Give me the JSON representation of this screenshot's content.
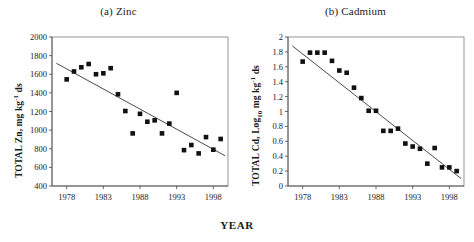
{
  "figure": {
    "xlabel": "YEAR",
    "panels": [
      {
        "id": "zinc",
        "title": "(a) Zinc",
        "ylabel_text": "TOTAL Zn, mg kg-1 ds"
      },
      {
        "id": "cadmium",
        "title": "(b) Cadmium",
        "ylabel_text": "TOTAL Cd, Log10 mg kg-1 ds"
      }
    ]
  },
  "chart_data": [
    {
      "type": "scatter",
      "title": "(a) Zinc",
      "xlabel": "YEAR",
      "ylabel": "TOTAL Zn, mg kg-1 ds",
      "xlim": [
        1976,
        2000
      ],
      "ylim": [
        400,
        2000
      ],
      "xticks": [
        1978,
        1983,
        1988,
        1993,
        1998
      ],
      "yticks": [
        400,
        600,
        800,
        1000,
        1200,
        1400,
        1600,
        1800,
        2000
      ],
      "grid": false,
      "legend": "none",
      "marker": "filled-square",
      "x": [
        1978,
        1979,
        1980,
        1981,
        1982,
        1983,
        1984,
        1985,
        1986,
        1987,
        1988,
        1989,
        1990,
        1991,
        1992,
        1993,
        1994,
        1995,
        1996,
        1997,
        1998,
        1999
      ],
      "values": [
        1545,
        1630,
        1675,
        1710,
        1600,
        1610,
        1665,
        1385,
        1205,
        965,
        1175,
        1090,
        1105,
        965,
        1070,
        1400,
        785,
        840,
        750,
        925,
        790,
        905
      ],
      "trend": {
        "x": [
          1976.6,
          1999.6
        ],
        "y": [
          1718,
          725
        ],
        "description": "linear regression line"
      }
    },
    {
      "type": "scatter",
      "title": "(b) Cadmium",
      "xlabel": "YEAR",
      "ylabel": "TOTAL Cd, Log10 mg kg-1 ds",
      "xlim": [
        1976,
        2000
      ],
      "ylim": [
        0,
        2
      ],
      "xticks": [
        1978,
        1983,
        1988,
        1993,
        1998
      ],
      "yticks": [
        0,
        0.2,
        0.4,
        0.6,
        0.8,
        1.0,
        1.2,
        1.4,
        1.6,
        1.8,
        2.0
      ],
      "grid": false,
      "legend": "none",
      "marker": "filled-square",
      "x": [
        1978,
        1979,
        1980,
        1981,
        1982,
        1983,
        1984,
        1985,
        1986,
        1987,
        1988,
        1989,
        1990,
        1991,
        1992,
        1993,
        1994,
        1995,
        1996,
        1997,
        1998,
        1999
      ],
      "values": [
        1.67,
        1.79,
        1.79,
        1.79,
        1.68,
        1.55,
        1.52,
        1.32,
        1.18,
        1.01,
        1.01,
        0.74,
        0.74,
        0.77,
        0.57,
        0.53,
        0.5,
        0.3,
        0.51,
        0.25,
        0.25,
        0.2
      ],
      "trend": {
        "x": [
          1976.6,
          1999.6
        ],
        "y": [
          1.88,
          0.1
        ],
        "description": "linear regression line"
      }
    }
  ]
}
